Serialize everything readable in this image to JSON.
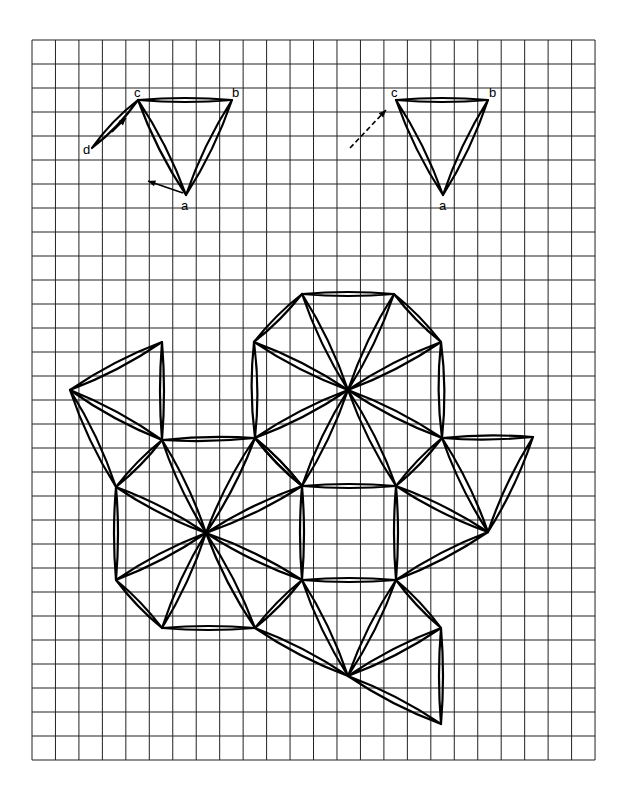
{
  "figure": {
    "grid": {
      "x0": 32,
      "y0": 40,
      "cols": 24,
      "rows": 30,
      "cell_w": 23.46,
      "cell_h": 24,
      "color": "#222222"
    },
    "line_color": "#000000",
    "top_left_triangle": {
      "labels": {
        "c": "c",
        "b": "b",
        "a": "a",
        "d": "d"
      },
      "vertices": {
        "c": [
          138,
          100
        ],
        "b": [
          232,
          100
        ],
        "a": [
          186,
          195
        ],
        "d": [
          92,
          148
        ]
      }
    },
    "top_right_triangle": {
      "labels": {
        "c": "c",
        "b": "b",
        "a": "a"
      },
      "vertices": {
        "c": [
          396,
          100
        ],
        "b": [
          488,
          100
        ],
        "a": [
          443,
          195
        ]
      }
    },
    "net": {
      "vertices": {
        "T1": [
          302,
          294
        ],
        "T2": [
          394,
          294
        ],
        "U1": [
          254,
          342
        ],
        "U2": [
          441,
          342
        ],
        "C1": [
          348,
          390
        ],
        "M1": [
          255,
          438
        ],
        "M2": [
          442,
          438
        ],
        "S1": [
          302,
          486
        ],
        "S2": [
          396,
          486
        ],
        "L1": [
          162,
          342
        ],
        "L2": [
          70,
          390
        ],
        "L3": [
          162,
          440
        ],
        "O1": [
          116,
          487
        ],
        "C2": [
          206,
          533
        ],
        "O2": [
          116,
          580
        ],
        "S3": [
          302,
          580
        ],
        "S4": [
          396,
          580
        ],
        "B1": [
          162,
          628
        ],
        "B2": [
          255,
          628
        ],
        "R1": [
          533,
          437
        ],
        "R2": [
          488,
          532
        ],
        "C3": [
          348,
          676
        ],
        "E1": [
          441,
          628
        ],
        "E2": [
          441,
          724
        ]
      }
    }
  }
}
